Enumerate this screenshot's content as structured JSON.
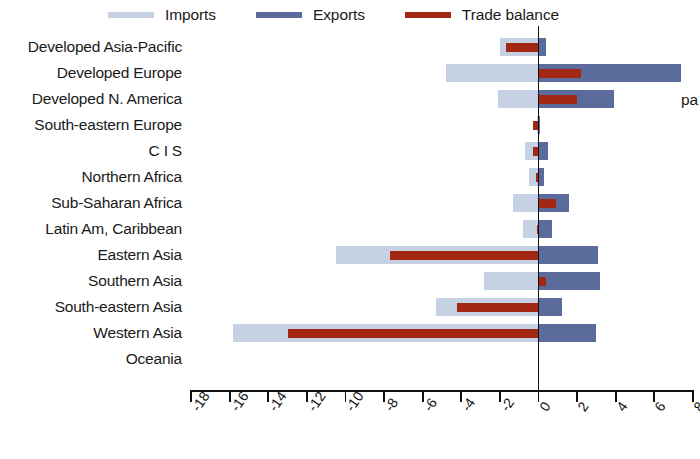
{
  "legend": {
    "items": [
      {
        "label": "Imports",
        "color": "#c6d2e4",
        "key": "imports"
      },
      {
        "label": "Exports",
        "color": "#5a6b9c",
        "key": "exports"
      },
      {
        "label": "Trade balance",
        "color": "#a32814",
        "key": "balance"
      }
    ]
  },
  "axis": {
    "ticks": [
      "-18",
      "-16",
      "-14",
      "-12",
      "-10",
      "-8",
      "-6",
      "-4",
      "-2",
      "0",
      "2",
      "4",
      "6",
      "8"
    ],
    "tick_values": [
      -18,
      -16,
      -14,
      -12,
      -10,
      -8,
      -6,
      -4,
      -2,
      0,
      2,
      4,
      6,
      8
    ]
  },
  "overflow_note": "pa",
  "chart_data": {
    "type": "bar",
    "orientation": "horizontal",
    "title": "",
    "xlabel": "",
    "ylabel": "",
    "xlim": [
      -18,
      8
    ],
    "grid": false,
    "legend_position": "top",
    "categories": [
      "Developed Asia-Pacific",
      "Developed Europe",
      "Developed N. America",
      "South-eastern Europe",
      "C I S",
      "Northern Africa",
      "Sub-Saharan Africa",
      "Latin Am, Caribbean",
      "Eastern Asia",
      "Southern Asia",
      "South-eastern Asia",
      "Western Asia",
      "Oceania"
    ],
    "series": [
      {
        "name": "Imports",
        "color": "#c6d2e4",
        "values": [
          -2.0,
          -4.8,
          -2.1,
          -0.1,
          -0.7,
          -0.5,
          -1.3,
          -0.8,
          -10.5,
          -2.8,
          -5.3,
          -15.8,
          0.0
        ]
      },
      {
        "name": "Exports",
        "color": "#5a6b9c",
        "values": [
          0.4,
          7.4,
          3.9,
          0.05,
          0.5,
          0.3,
          1.6,
          0.7,
          3.1,
          3.2,
          1.2,
          3.0,
          0.0
        ]
      },
      {
        "name": "Trade balance",
        "color": "#a32814",
        "values": [
          -1.7,
          2.2,
          2.0,
          -0.3,
          -0.3,
          -0.15,
          0.9,
          -0.1,
          -7.7,
          0.4,
          -4.2,
          -13.0,
          0.0
        ]
      }
    ]
  }
}
